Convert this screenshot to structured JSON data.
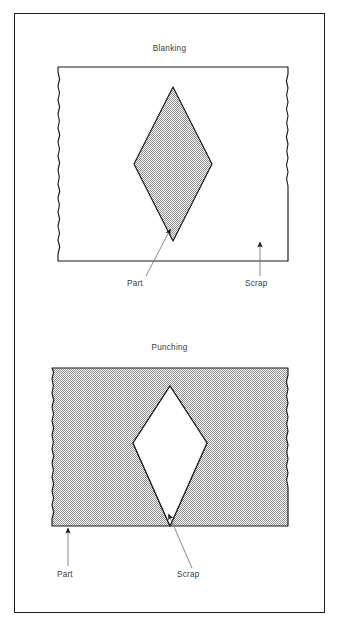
{
  "figure": {
    "border_color": "#1b1b1b",
    "background": "#ffffff",
    "sheet_fill_gray": "#c8c8c8",
    "line_color": "#1b1b1b",
    "text_color": "#3a3a3a"
  },
  "panels": [
    {
      "id": "blanking",
      "title": "Blanking",
      "sheet": {
        "shaded": false,
        "edge_style": "wavy-sides"
      },
      "diamond": {
        "shaded": true,
        "label_role": "part"
      },
      "labels": [
        {
          "name": "part",
          "text": "Part",
          "points_to": "diamond"
        },
        {
          "name": "scrap",
          "text": "Scrap",
          "points_to": "sheet"
        }
      ]
    },
    {
      "id": "punching",
      "title": "Punching",
      "sheet": {
        "shaded": true,
        "edge_style": "wavy-sides"
      },
      "diamond": {
        "shaded": false,
        "label_role": "scrap"
      },
      "labels": [
        {
          "name": "part",
          "text": "Part",
          "points_to": "sheet"
        },
        {
          "name": "scrap",
          "text": "Scrap",
          "points_to": "diamond"
        }
      ]
    }
  ]
}
